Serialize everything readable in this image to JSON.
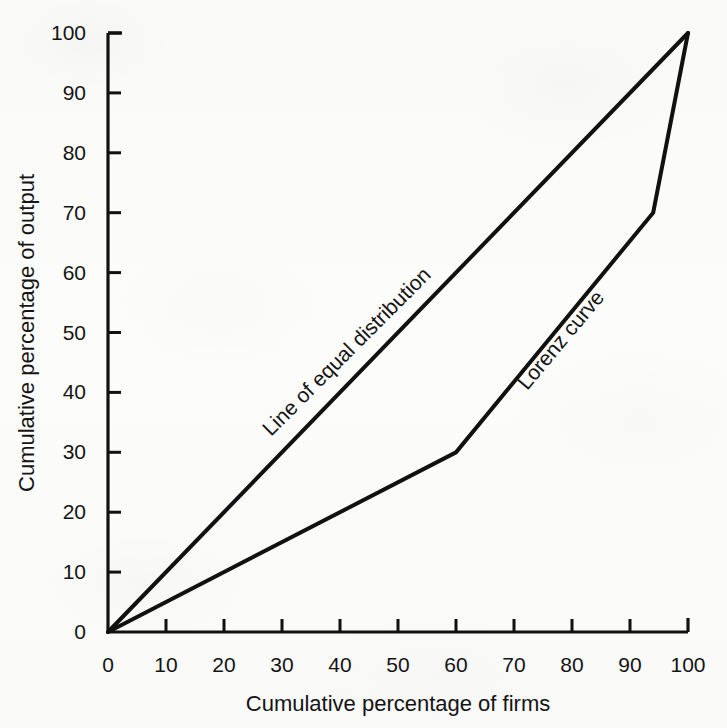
{
  "chart_data": {
    "type": "line",
    "title": "",
    "xlabel": "Cumulative percentage of firms",
    "ylabel": "Cumulative percentage of output",
    "xlim": [
      0,
      100
    ],
    "ylim": [
      0,
      100
    ],
    "xticks": [
      0,
      10,
      20,
      30,
      40,
      50,
      60,
      70,
      80,
      90,
      100
    ],
    "yticks": [
      0,
      10,
      20,
      30,
      40,
      50,
      60,
      70,
      80,
      90,
      100
    ],
    "xtick_labels": [
      "0",
      "10",
      "20",
      "30",
      "40",
      "50",
      "60",
      "70",
      "80",
      "90",
      "100"
    ],
    "ytick_labels": [
      "0",
      "10",
      "20",
      "30",
      "40",
      "50",
      "60",
      "70",
      "80",
      "90",
      "100"
    ],
    "grid": false,
    "legend": "inline-annotations",
    "line_color": "#111111",
    "background_color": "#fdfdfc",
    "series": [
      {
        "name": "Line of equal distribution",
        "label_text": "Line of equal distribution",
        "label_x": 42,
        "label_y": 46,
        "label_rotation": -45,
        "x": [
          0,
          100
        ],
        "y": [
          0,
          100
        ]
      },
      {
        "name": "Lorenz curve",
        "label_text": "Lorenz curve",
        "label_x": 79,
        "label_y": 48,
        "label_rotation": -50,
        "x": [
          0,
          60,
          94,
          100
        ],
        "y": [
          0,
          30,
          70,
          100
        ]
      }
    ]
  },
  "axes": {
    "y_axis_title": "Cumulative percentage of output",
    "x_axis_title": "Cumulative percentage of firms"
  }
}
